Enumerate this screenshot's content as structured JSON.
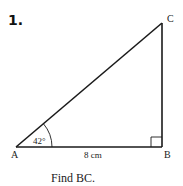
{
  "problem": {
    "number": "1.",
    "question": "Find BC."
  },
  "triangle": {
    "vertices": {
      "A": {
        "label": "A"
      },
      "B": {
        "label": "B"
      },
      "C": {
        "label": "C"
      }
    },
    "angle_A": "42°",
    "side_AB": "8 cm",
    "right_angle_at": "B"
  },
  "colors": {
    "stroke": "#1a1a1a",
    "background": "#ffffff"
  }
}
